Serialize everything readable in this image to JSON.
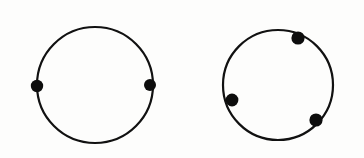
{
  "figure": {
    "canvas": {
      "width": 364,
      "height": 158
    },
    "background_color": "#fdfdfc",
    "stroke_color": "#111111",
    "dot_color": "#0d0d0d",
    "shapes": [
      {
        "name": "left-circle",
        "label": "Circle with 2 nodes",
        "cx": 95,
        "cy": 85,
        "r": 58,
        "stroke_width": 2.2,
        "dots": [
          {
            "name": "left-circle-dot-west",
            "cx": 37,
            "cy": 86,
            "r": 6.2,
            "angle_deg": 181
          },
          {
            "name": "left-circle-dot-east",
            "cx": 150,
            "cy": 85,
            "r": 6.0,
            "angle_deg": 0
          }
        ]
      },
      {
        "name": "right-circle",
        "label": "Circle with 3 nodes",
        "cx": 278,
        "cy": 85,
        "r": 55,
        "stroke_width": 2.2,
        "dots": [
          {
            "name": "right-circle-dot-north-east",
            "cx": 298,
            "cy": 38,
            "r": 6.6,
            "angle_deg": 67
          },
          {
            "name": "right-circle-dot-south-west",
            "cx": 232,
            "cy": 100,
            "r": 6.4,
            "angle_deg": 198
          },
          {
            "name": "right-circle-dot-south-east",
            "cx": 316,
            "cy": 120,
            "r": 6.6,
            "angle_deg": 318
          }
        ]
      }
    ]
  }
}
